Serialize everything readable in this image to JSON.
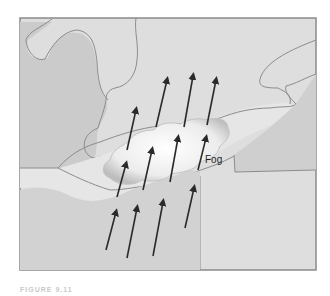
{
  "figure": {
    "label_fog": "Fog",
    "caption": "FIGURE 9.11",
    "colors": {
      "frame_border": "#8a8a8a",
      "land_light": "#dcdcdc",
      "land_dark": "#cccccc",
      "water": "#d3d3d3",
      "shoreline": "#8c8c8c",
      "arrow": "#2a2a2a",
      "fog": "#f4f4f4"
    },
    "arrows_count": 12,
    "arrow_direction": "north-northeast"
  }
}
